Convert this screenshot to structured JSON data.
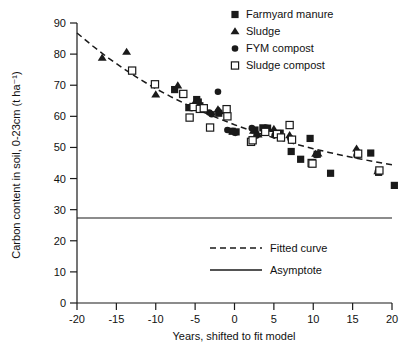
{
  "chart_data": {
    "type": "scatter",
    "title": "",
    "xlabel": "Years, shifted to fit model",
    "ylabel": "Carbon content in soil, 0-23cm (t ha⁻¹)",
    "xlim": [
      -20,
      20
    ],
    "ylim": [
      0,
      90
    ],
    "xticks": [
      -20,
      -15,
      -10,
      -5,
      0,
      5,
      10,
      15,
      20
    ],
    "xtick_labels": [
      "-20",
      "-15",
      "-10",
      "-5",
      "0",
      "5",
      "10",
      "15",
      "20"
    ],
    "yticks": [
      0,
      10,
      20,
      30,
      40,
      50,
      60,
      70,
      80,
      90
    ],
    "ytick_labels": [
      "0",
      "10",
      "20",
      "30",
      "40",
      "50",
      "60",
      "70",
      "80",
      "90"
    ],
    "grid": false,
    "legend_position": "top-right",
    "series": [
      {
        "name": "Farmyard manure",
        "marker": "filled-square",
        "color": "#1a1a1a",
        "points": [
          [
            -7.6,
            68.6
          ],
          [
            -6.6,
            67.2
          ],
          [
            -5.8,
            62.8
          ],
          [
            -4.8,
            65.4
          ],
          [
            -4.6,
            64.6
          ],
          [
            -4.4,
            63.4
          ],
          [
            -2.0,
            61.0
          ],
          [
            -0.3,
            55.2
          ],
          [
            0.2,
            55.0
          ],
          [
            2.6,
            55.6
          ],
          [
            3.6,
            56.3
          ],
          [
            4.2,
            56.2
          ],
          [
            5.3,
            54.3
          ],
          [
            5.8,
            54.6
          ],
          [
            7.2,
            48.7
          ],
          [
            8.4,
            46.2
          ],
          [
            9.6,
            52.9
          ],
          [
            10.5,
            47.8
          ],
          [
            12.2,
            41.7
          ],
          [
            17.3,
            48.2
          ],
          [
            18.3,
            42.0
          ],
          [
            20.3,
            37.8
          ]
        ]
      },
      {
        "name": "Sludge",
        "marker": "filled-triangle",
        "color": "#1a1a1a",
        "points": [
          [
            -16.8,
            78.8
          ],
          [
            -13.7,
            80.7
          ],
          [
            -10.0,
            67.0
          ],
          [
            -7.2,
            69.9
          ],
          [
            -4.9,
            65.0
          ],
          [
            -4.6,
            64.3
          ],
          [
            -2.1,
            62.2
          ],
          [
            -1.9,
            61.6
          ],
          [
            2.4,
            55.3
          ],
          [
            3.0,
            54.1
          ],
          [
            5.0,
            55.9
          ],
          [
            5.2,
            54.2
          ],
          [
            7.0,
            53.9
          ],
          [
            10.3,
            47.9
          ],
          [
            10.6,
            48.0
          ],
          [
            15.5,
            49.6
          ],
          [
            18.2,
            42.3
          ]
        ]
      },
      {
        "name": "FYM compost",
        "marker": "filled-circle",
        "color": "#1a1a1a",
        "points": [
          [
            -2.9,
            60.7
          ],
          [
            -2.1,
            67.9
          ],
          [
            -5.4,
            62.7
          ],
          [
            -4.2,
            62.1
          ],
          [
            -3.2,
            61.2
          ],
          [
            -0.9,
            55.6
          ],
          [
            0.1,
            54.7
          ],
          [
            2.2,
            56.2
          ],
          [
            2.8,
            53.8
          ],
          [
            4.1,
            56.3
          ],
          [
            5.1,
            53.9
          ],
          [
            7.1,
            52.9
          ],
          [
            10.4,
            47.6
          ],
          [
            15.5,
            47.4
          ],
          [
            18.2,
            42.2
          ],
          [
            -0.2,
            55.3
          ]
        ]
      },
      {
        "name": "Sludge compost",
        "marker": "open-square",
        "color": "#1a1a1a",
        "points": [
          [
            -13.0,
            74.7
          ],
          [
            -10.1,
            70.3
          ],
          [
            -6.5,
            67.2
          ],
          [
            -5.7,
            59.6
          ],
          [
            -5.2,
            63.0
          ],
          [
            -4.4,
            62.4
          ],
          [
            -3.1,
            56.4
          ],
          [
            -1.0,
            62.3
          ],
          [
            -0.9,
            60.0
          ],
          [
            2.1,
            51.8
          ],
          [
            2.3,
            52.3
          ],
          [
            5.4,
            54.3
          ],
          [
            5.9,
            53.2
          ],
          [
            7.0,
            57.2
          ],
          [
            7.3,
            52.5
          ],
          [
            9.8,
            45.0
          ],
          [
            9.9,
            44.8
          ],
          [
            15.7,
            48.0
          ],
          [
            18.4,
            42.6
          ],
          [
            3.9,
            55.0
          ],
          [
            -3.9,
            62.6
          ]
        ]
      }
    ],
    "fitted_curve": {
      "label": "Fitted curve",
      "style": "dashed",
      "points": [
        [
          -20,
          86.8
        ],
        [
          -18,
          82.6
        ],
        [
          -16,
          78.7
        ],
        [
          -14,
          75.2
        ],
        [
          -12,
          71.9
        ],
        [
          -10,
          68.9
        ],
        [
          -8,
          66.2
        ],
        [
          -6,
          63.7
        ],
        [
          -4,
          61.4
        ],
        [
          -2,
          59.3
        ],
        [
          0,
          57.3
        ],
        [
          2,
          55.5
        ],
        [
          4,
          53.9
        ],
        [
          6,
          52.3
        ],
        [
          8,
          50.9
        ],
        [
          10,
          49.6
        ],
        [
          12,
          48.4
        ],
        [
          14,
          47.3
        ],
        [
          16,
          46.3
        ],
        [
          18,
          45.3
        ],
        [
          20,
          44.4
        ]
      ]
    },
    "asymptote": {
      "label": "Asymptote",
      "style": "solid",
      "value": 27.3
    }
  },
  "legend": {
    "items": [
      {
        "label": "Farmyard manure",
        "marker": "filled-square"
      },
      {
        "label": "Sludge",
        "marker": "filled-triangle"
      },
      {
        "label": "FYM compost",
        "marker": "filled-circle"
      },
      {
        "label": "Sludge compost",
        "marker": "open-square"
      }
    ]
  },
  "line_legend": {
    "items": [
      {
        "label": "Fitted curve",
        "style": "dashed"
      },
      {
        "label": "Asymptote",
        "style": "solid"
      }
    ]
  }
}
